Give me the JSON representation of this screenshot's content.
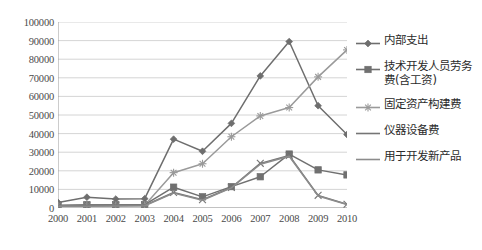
{
  "chart_data": {
    "type": "line",
    "title": "",
    "xlabel": "",
    "ylabel": "",
    "categories": [
      "2000",
      "2001",
      "2002",
      "2003",
      "2004",
      "2005",
      "2006",
      "2007",
      "2008",
      "2009",
      "2010"
    ],
    "ylim": [
      0,
      100000
    ],
    "ytick_values": [
      0,
      10000,
      20000,
      30000,
      40000,
      50000,
      60000,
      70000,
      80000,
      90000,
      100000
    ],
    "ytick_labels": [
      "0",
      "10000",
      "20000",
      "30000",
      "40000",
      "50000",
      "60000",
      "70000",
      "80000",
      "90000",
      "100000"
    ],
    "grid": true,
    "legend_position": "right",
    "series": [
      {
        "name": "内部支出",
        "marker": "diamond",
        "color": "#6e6e6e",
        "values": [
          3000,
          5800,
          4800,
          5000,
          37000,
          30500,
          45500,
          71000,
          89500,
          55000,
          39500
        ]
      },
      {
        "name": "技术开发人员劳务\n费(含工资)",
        "marker": "square",
        "color": "#707070",
        "values": [
          1500,
          1800,
          1800,
          1800,
          11200,
          6000,
          11500,
          16800,
          29000,
          20500,
          17800
        ]
      },
      {
        "name": "固定资产构建费",
        "marker": "star",
        "color": "#9a9a9a",
        "values": [
          1200,
          1300,
          1400,
          1500,
          19000,
          23800,
          38300,
          49500,
          54000,
          70500,
          85000
        ]
      },
      {
        "name": "仪器设备费",
        "marker": "x",
        "color": "#757575",
        "values": [
          1100,
          1200,
          1300,
          1400,
          8300,
          4500,
          11000,
          24000,
          28200,
          6800,
          2000
        ]
      },
      {
        "name": "用于开发新产品",
        "marker": "none",
        "color": "#8c8c8c",
        "values": [
          900,
          1000,
          1100,
          1200,
          8000,
          4200,
          10800,
          23500,
          27800,
          6500,
          1800
        ]
      }
    ]
  },
  "legend": {
    "items": [
      {
        "label": "内部支出",
        "symbol": "diamond"
      },
      {
        "label": "技术开发人员劳务\n费(含工资)",
        "symbol": "square"
      },
      {
        "label": "固定资产构建费",
        "symbol": "star"
      },
      {
        "label": "仪器设备费",
        "symbol": "line"
      },
      {
        "label": "用于开发新产品",
        "symbol": "line"
      }
    ]
  }
}
